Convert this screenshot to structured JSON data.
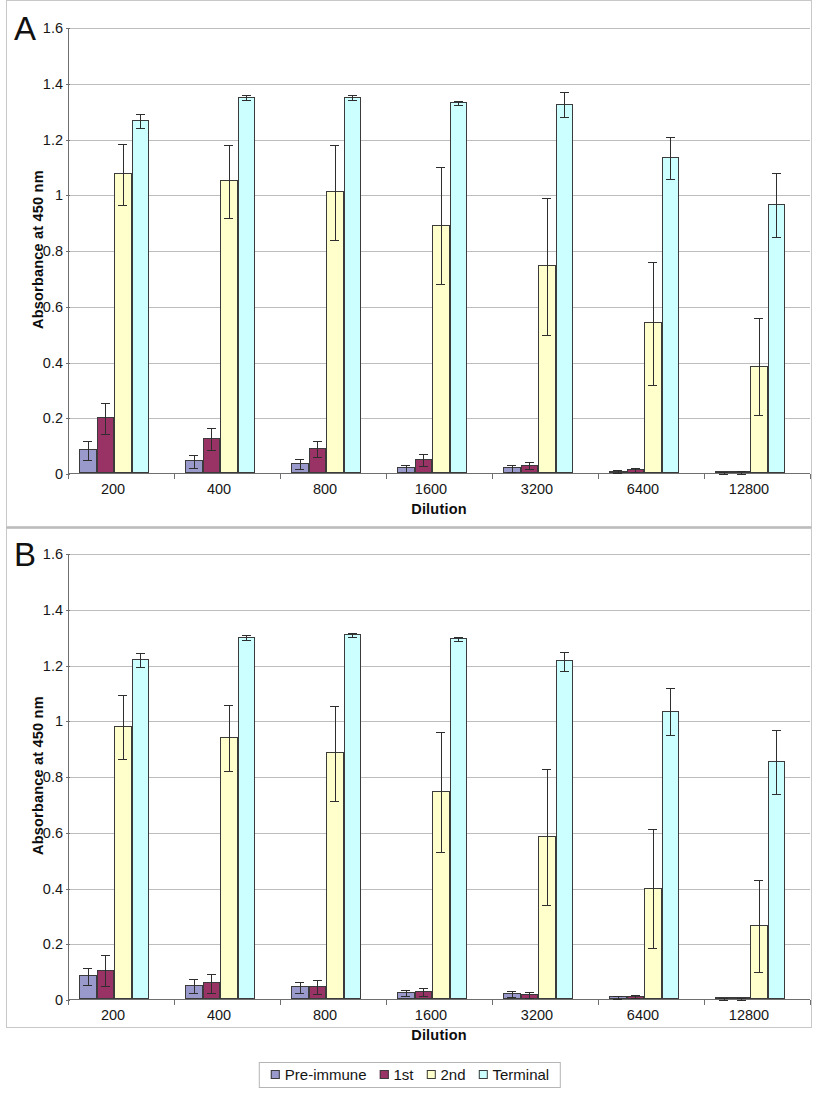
{
  "figure": {
    "panels": [
      {
        "letter": "A",
        "ylabel": "Absorbance at 450 nm",
        "xlabel": "Dilution"
      },
      {
        "letter": "B",
        "ylabel": "Absorbance at 450 nm",
        "xlabel": "Dilution"
      }
    ]
  },
  "legend": {
    "items": [
      {
        "label": "Pre-immune",
        "color": "#9999cc"
      },
      {
        "label": "1st",
        "color": "#993366"
      },
      {
        "label": "2nd",
        "color": "#ffffcc"
      },
      {
        "label": "Terminal",
        "color": "#ccffff"
      }
    ]
  },
  "axis": {
    "yticks": [
      "0",
      "0.2",
      "0.4",
      "0.6",
      "0.8",
      "1",
      "1.2",
      "1.4",
      "1.6"
    ],
    "ytick_values": [
      0,
      0.2,
      0.4,
      0.6,
      0.8,
      1.0,
      1.2,
      1.4,
      1.6
    ],
    "ymin": 0,
    "ymax": 1.6,
    "xcategories": [
      "200",
      "400",
      "800",
      "1600",
      "3200",
      "6400",
      "12800"
    ]
  },
  "chart_data": [
    {
      "type": "bar",
      "panel": "A",
      "title": "",
      "xlabel": "Dilution",
      "ylabel": "Absorbance at 450 nm",
      "ylim": [
        0,
        1.6
      ],
      "ytick_step": 0.2,
      "grid": true,
      "legend_position": "below-figure",
      "categories": [
        "200",
        "400",
        "800",
        "1600",
        "3200",
        "6400",
        "12800"
      ],
      "series": [
        {
          "name": "Pre-immune",
          "color": "#9999cc",
          "values": [
            0.085,
            0.045,
            0.035,
            0.02,
            0.02,
            0.008,
            0.004
          ],
          "errors": [
            0.035,
            0.022,
            0.018,
            0.012,
            0.012,
            0.006,
            0.003
          ]
        },
        {
          "name": "1st",
          "color": "#993366",
          "values": [
            0.2,
            0.125,
            0.09,
            0.05,
            0.03,
            0.015,
            0.005
          ],
          "errors": [
            0.055,
            0.04,
            0.03,
            0.022,
            0.013,
            0.008,
            0.004
          ]
        },
        {
          "name": "2nd",
          "color": "#ffffcc",
          "values": [
            1.075,
            1.05,
            1.01,
            0.89,
            0.745,
            0.54,
            0.385
          ],
          "errors": [
            0.11,
            0.13,
            0.17,
            0.21,
            0.245,
            0.22,
            0.175
          ]
        },
        {
          "name": "Terminal",
          "color": "#ccffff",
          "values": [
            1.265,
            1.35,
            1.35,
            1.33,
            1.325,
            1.135,
            0.965
          ],
          "errors": [
            0.025,
            0.008,
            0.008,
            0.008,
            0.045,
            0.075,
            0.115
          ]
        }
      ]
    },
    {
      "type": "bar",
      "panel": "B",
      "title": "",
      "xlabel": "Dilution",
      "ylabel": "Absorbance at 450 nm",
      "ylim": [
        0,
        1.6
      ],
      "ytick_step": 0.2,
      "grid": true,
      "legend_position": "below-figure",
      "categories": [
        "200",
        "400",
        "800",
        "1600",
        "3200",
        "6400",
        "12800"
      ],
      "series": [
        {
          "name": "Pre-immune",
          "color": "#9999cc",
          "values": [
            0.085,
            0.05,
            0.045,
            0.025,
            0.022,
            0.01,
            0.004
          ],
          "errors": [
            0.03,
            0.025,
            0.02,
            0.012,
            0.01,
            0.006,
            0.003
          ]
        },
        {
          "name": "1st",
          "color": "#993366",
          "values": [
            0.105,
            0.06,
            0.045,
            0.028,
            0.018,
            0.012,
            0.004
          ],
          "errors": [
            0.055,
            0.035,
            0.025,
            0.015,
            0.01,
            0.006,
            0.003
          ]
        },
        {
          "name": "2nd",
          "color": "#ffffcc",
          "values": [
            0.98,
            0.94,
            0.885,
            0.745,
            0.585,
            0.4,
            0.265
          ],
          "errors": [
            0.115,
            0.12,
            0.17,
            0.215,
            0.245,
            0.215,
            0.165
          ]
        },
        {
          "name": "Terminal",
          "color": "#ccffff",
          "values": [
            1.22,
            1.3,
            1.31,
            1.295,
            1.215,
            1.035,
            0.855
          ],
          "errors": [
            0.025,
            0.01,
            0.008,
            0.006,
            0.035,
            0.085,
            0.115
          ]
        }
      ]
    }
  ]
}
